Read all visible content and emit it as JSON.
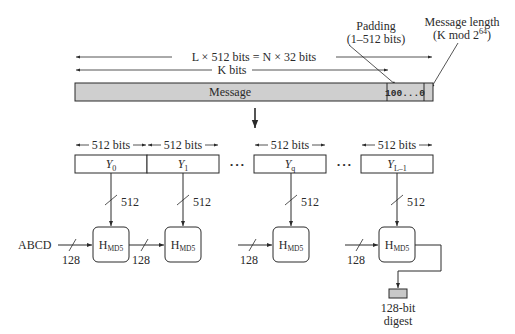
{
  "diagram": {
    "top_labels": {
      "total_length": "L × 512 bits = N × 32 bits",
      "k_bits": "K bits",
      "padding_label_line1": "Padding",
      "padding_label_line2": "(1–512 bits)",
      "length_label_line1": "Message length",
      "length_label_line2_prefix": "(K mod 2",
      "length_label_line2_exp": "64",
      "length_label_line2_suffix": ")"
    },
    "message_bar": {
      "message_label": "Message",
      "padding_content": "100...0",
      "fill_color": "#cfcfcf"
    },
    "blocks": [
      {
        "base": "Y",
        "sub": "0",
        "width_label": "512 bits"
      },
      {
        "base": "Y",
        "sub": "1",
        "width_label": "512 bits"
      },
      {
        "base": "Y",
        "sub": "q",
        "width_label": "512 bits"
      },
      {
        "base": "Y",
        "sub": "L–1",
        "width_label": "512 bits"
      }
    ],
    "ellipsis": "• • •",
    "block_input_width": "512",
    "chain_width": "128",
    "iv_label": "ABCD",
    "compression_function": {
      "base": "H",
      "sub": "MD5"
    },
    "output": {
      "line1": "128-bit",
      "line2": "digest",
      "fill_color": "#c8c8c8"
    }
  }
}
